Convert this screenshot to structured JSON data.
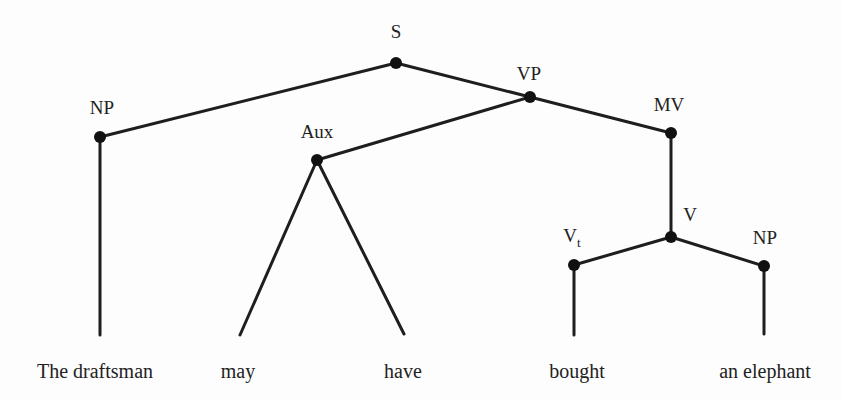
{
  "tree": {
    "nodes": [
      {
        "id": "S",
        "label": "S",
        "x": 396,
        "y": 63,
        "lx": 396,
        "ly": 22
      },
      {
        "id": "NP1",
        "label": "NP",
        "x": 100,
        "y": 137,
        "lx": 102,
        "ly": 98
      },
      {
        "id": "VP",
        "label": "VP",
        "x": 530,
        "y": 97,
        "lx": 529,
        "ly": 64
      },
      {
        "id": "Aux",
        "label": "Aux",
        "x": 317,
        "y": 160,
        "lx": 317,
        "ly": 122
      },
      {
        "id": "MV",
        "label": "MV",
        "x": 671,
        "y": 133,
        "lx": 669,
        "ly": 95
      },
      {
        "id": "V",
        "label": "V",
        "x": 671,
        "y": 237,
        "lx": 690,
        "ly": 205
      },
      {
        "id": "Vt",
        "label": "V",
        "sub": "t",
        "x": 574,
        "y": 265,
        "lx": 572,
        "ly": 226
      },
      {
        "id": "NP2",
        "label": "NP",
        "x": 764,
        "y": 266,
        "lx": 765,
        "ly": 228
      }
    ],
    "edges": [
      [
        "S",
        "NP1"
      ],
      [
        "S",
        "VP"
      ],
      [
        "VP",
        "Aux"
      ],
      [
        "VP",
        "MV"
      ],
      [
        "MV",
        "V"
      ],
      [
        "V",
        "Vt"
      ],
      [
        "V",
        "NP2"
      ]
    ],
    "leaf_lines": [
      {
        "x1": 100,
        "y1": 137,
        "x2": 100,
        "y2": 335
      },
      {
        "x1": 317,
        "y1": 160,
        "x2": 240,
        "y2": 335
      },
      {
        "x1": 317,
        "y1": 160,
        "x2": 404,
        "y2": 334
      },
      {
        "x1": 574,
        "y1": 265,
        "x2": 574,
        "y2": 335
      },
      {
        "x1": 764,
        "y1": 266,
        "x2": 764,
        "y2": 334
      }
    ],
    "words": [
      {
        "text": "The draftsman",
        "x": 95,
        "y": 361
      },
      {
        "text": "may",
        "x": 238,
        "y": 361
      },
      {
        "text": "have",
        "x": 403,
        "y": 361
      },
      {
        "text": "bought",
        "x": 577,
        "y": 361
      },
      {
        "text": "an elephant",
        "x": 765,
        "y": 361
      }
    ],
    "line_color": "#1e1e1e"
  }
}
